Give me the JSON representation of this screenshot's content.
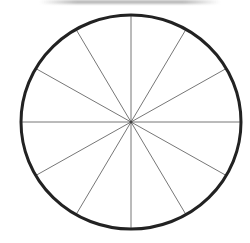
{
  "diagram": {
    "type": "circle-divided-into-sectors",
    "sectors": 12,
    "spokes": 12,
    "spoke_angle_step_deg": 30,
    "center": [
      131,
      122
    ],
    "radius_x": 110,
    "radius_y": 107,
    "outline_color": "#222222",
    "outline_width": 3,
    "spoke_color": "#777777",
    "spoke_width": 1,
    "background": "#ffffff"
  }
}
